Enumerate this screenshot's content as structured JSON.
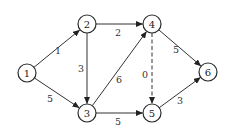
{
  "diagram": {
    "type": "directed-weighted-graph",
    "node_radius": 9,
    "colors": {
      "stroke": "#2a2a2a",
      "edge": "#333333",
      "background": "#ffffff",
      "text": "#222222"
    },
    "nodes": [
      {
        "id": "1",
        "label": "1",
        "x": 27,
        "y": 73
      },
      {
        "id": "2",
        "label": "2",
        "x": 87,
        "y": 24
      },
      {
        "id": "3",
        "label": "3",
        "x": 87,
        "y": 113
      },
      {
        "id": "4",
        "label": "4",
        "x": 152,
        "y": 24
      },
      {
        "id": "5",
        "label": "5",
        "x": 152,
        "y": 113
      },
      {
        "id": "6",
        "label": "6",
        "x": 208,
        "y": 72
      }
    ],
    "edges": [
      {
        "from": "1",
        "to": "2",
        "weight": "1",
        "style": "solid",
        "label_x": 58,
        "label_y": 50
      },
      {
        "from": "1",
        "to": "3",
        "weight": "5",
        "style": "solid",
        "label_x": 50,
        "label_y": 98
      },
      {
        "from": "2",
        "to": "3",
        "weight": "3",
        "style": "solid",
        "label_x": 81,
        "label_y": 68
      },
      {
        "from": "2",
        "to": "4",
        "weight": "2",
        "style": "solid",
        "label_x": 118,
        "label_y": 32
      },
      {
        "from": "3",
        "to": "4",
        "weight": "6",
        "style": "solid",
        "label_x": 119,
        "label_y": 79
      },
      {
        "from": "3",
        "to": "5",
        "weight": "5",
        "style": "solid",
        "label_x": 118,
        "label_y": 121
      },
      {
        "from": "4",
        "to": "5",
        "weight": "0",
        "style": "dashed",
        "label_x": 145,
        "label_y": 74
      },
      {
        "from": "4",
        "to": "6",
        "weight": "5",
        "style": "solid",
        "label_x": 176,
        "label_y": 49
      },
      {
        "from": "5",
        "to": "6",
        "weight": "3",
        "style": "solid",
        "label_x": 180,
        "label_y": 100
      }
    ]
  }
}
